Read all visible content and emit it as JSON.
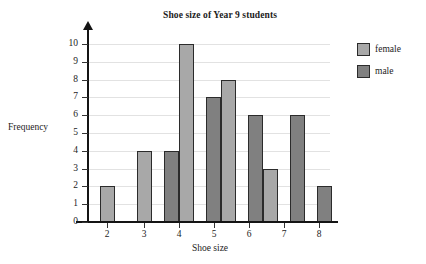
{
  "chart_data": {
    "type": "bar",
    "title": "Shoe size of Year 9 students",
    "xlabel": "Shoe size",
    "ylabel": "Frequency",
    "categories": [
      "2",
      "3",
      "4",
      "5",
      "6",
      "7",
      "8"
    ],
    "series": [
      {
        "name": "female",
        "color": "#a8a8a8",
        "values": [
          2,
          4,
          10,
          8,
          3,
          null,
          null
        ]
      },
      {
        "name": "male",
        "color": "#808080",
        "values": [
          null,
          null,
          4,
          7,
          6,
          6,
          2
        ]
      }
    ],
    "bars": [
      {
        "category": "2",
        "group": "female",
        "value": 2,
        "x": 100,
        "width": 15
      },
      {
        "category": "3",
        "group": "female",
        "value": 4,
        "x": 137,
        "width": 15
      },
      {
        "category": "4",
        "group": "male",
        "value": 4,
        "x": 164,
        "width": 15
      },
      {
        "category": "4",
        "group": "female",
        "value": 10,
        "x": 179,
        "width": 15
      },
      {
        "category": "5",
        "group": "male",
        "value": 7,
        "x": 206,
        "width": 15
      },
      {
        "category": "5",
        "group": "female",
        "value": 8,
        "x": 221,
        "width": 15
      },
      {
        "category": "6",
        "group": "male",
        "value": 6,
        "x": 248,
        "width": 15
      },
      {
        "category": "6",
        "group": "female",
        "value": 3,
        "x": 263,
        "width": 15
      },
      {
        "category": "7",
        "group": "male",
        "value": 6,
        "x": 290,
        "width": 15
      },
      {
        "category": "8",
        "group": "male",
        "value": 2,
        "x": 317,
        "width": 15
      }
    ],
    "y_ticks": [
      0,
      1,
      2,
      3,
      4,
      5,
      6,
      7,
      8,
      9,
      10
    ],
    "ylim": [
      0,
      10
    ],
    "x_tick_positions": [
      107,
      144,
      179,
      214,
      249,
      284,
      319
    ],
    "grid": true,
    "legend_position": "right",
    "legend": [
      {
        "label": "female",
        "color": "#a8a8a8"
      },
      {
        "label": "male",
        "color": "#808080"
      }
    ]
  },
  "colors": {
    "female": "#a8a8a8",
    "male": "#808080",
    "axis": "#141414",
    "grid": "#e2e2e2",
    "text": "#1c1c1c",
    "background": "#ffffff"
  }
}
